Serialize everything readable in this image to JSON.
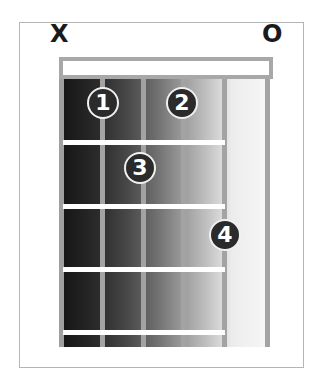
{
  "chord_diagram": {
    "string_markers": [
      {
        "string": 6,
        "label": "X",
        "meaning": "muted"
      },
      {
        "string": 1,
        "label": "O",
        "meaning": "open"
      }
    ],
    "strings": 6,
    "frets_shown": 4,
    "fingers": [
      {
        "label": "1",
        "string": 5,
        "fret": 1
      },
      {
        "label": "2",
        "string": 3,
        "fret": 1
      },
      {
        "label": "3",
        "string": 4,
        "fret": 2
      },
      {
        "label": "4",
        "string": 2,
        "fret": 3
      }
    ],
    "colors": {
      "frame": "#a8a8a8",
      "gradient_dark": "#161616",
      "gradient_light": "#f7f7f7",
      "finger_dot": "#2b2b2b"
    }
  }
}
